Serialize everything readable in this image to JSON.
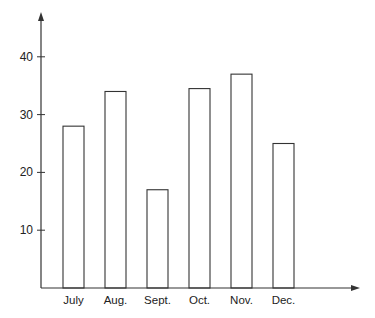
{
  "chart_data": {
    "type": "bar",
    "title": "",
    "xlabel": "",
    "ylabel": "",
    "categories": [
      "July",
      "Aug.",
      "Sept.",
      "Oct.",
      "Nov.",
      "Dec."
    ],
    "values": [
      28,
      34,
      17,
      34.5,
      37,
      25
    ],
    "ylim": [
      0,
      45
    ],
    "yticks": [
      10,
      20,
      30,
      40
    ],
    "grid": false,
    "legend": null,
    "bar_fill": "#ffffff",
    "bar_stroke": "#333333",
    "axis_color": "#333333"
  }
}
